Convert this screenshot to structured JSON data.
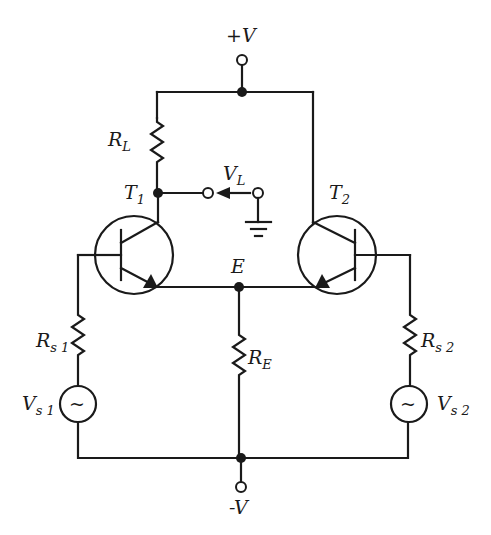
{
  "diagram": {
    "labels": {
      "supply_pos": "+V",
      "supply_neg": "-V",
      "load_resistor": {
        "main": "R",
        "sub": "L"
      },
      "output_voltage": {
        "main": "V",
        "sub": "L"
      },
      "transistor1": {
        "main": "T",
        "sub": "1"
      },
      "transistor2": {
        "main": "T",
        "sub": "2"
      },
      "emitter_node": "E",
      "emitter_resistor": {
        "main": "R",
        "sub": "E"
      },
      "source_resistor1": {
        "main": "R",
        "sub": "s 1"
      },
      "source_resistor2": {
        "main": "R",
        "sub": "s 2"
      },
      "source1": {
        "main": "V",
        "sub": "s 1"
      },
      "source2": {
        "main": "V",
        "sub": "s 2"
      },
      "ac_symbol": "~"
    },
    "colors": {
      "line": "#1a1a1a",
      "background": "#ffffff"
    }
  }
}
